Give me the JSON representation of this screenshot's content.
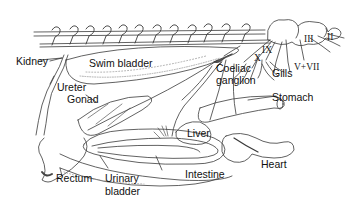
{
  "diagram": {
    "type": "anatomical-illustration",
    "labels": {
      "kidney": "Kidney",
      "swim_bladder": "Swim bladder",
      "ureter": "Ureter",
      "gonad": "Gonad",
      "rectum": "Rectum",
      "urinary_bladder_line1": "Urinary",
      "urinary_bladder_line2": "bladder",
      "intestine": "Intestine",
      "liver": "Liver",
      "heart": "Heart",
      "stomach": "Stomach",
      "coeliac_line1": "Coeliac",
      "coeliac_line2": "ganglion",
      "gills": "Gills"
    },
    "cranial_nerves": {
      "x": "X",
      "ix": "IX",
      "v_vii": "V+VII",
      "iii": "III",
      "ii": "II"
    },
    "colors": {
      "line": "#3a3a3a",
      "stipple": "#9a9a9a",
      "background": "#ffffff"
    }
  }
}
